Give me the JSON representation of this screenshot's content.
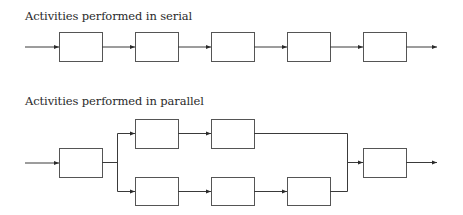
{
  "serial": {
    "title": "Activities performed in serial",
    "activities": [
      "",
      "",
      "",
      "",
      ""
    ]
  },
  "parallel": {
    "title": "Activities performed in parallel",
    "start_activity": "",
    "branches": [
      {
        "name": "top",
        "activities": [
          "",
          ""
        ]
      },
      {
        "name": "bottom",
        "activities": [
          "",
          "",
          ""
        ]
      }
    ],
    "end_activity": ""
  },
  "colors": {
    "line": "#3a3a3a",
    "box_stroke": "#555555",
    "text": "#2a2a2a"
  }
}
